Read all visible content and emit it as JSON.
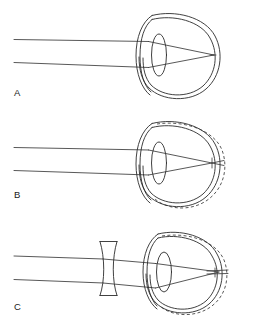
{
  "figure": {
    "width": 253,
    "height": 334,
    "background_color": "#ffffff",
    "line_color": "#2b2b2b",
    "panel_count": 3
  },
  "panels": [
    {
      "id": "A",
      "label": "A",
      "label_x": 14,
      "label_y": 96,
      "caption": "Normal (emmetropic) eye: parallel light rays focus on the retina",
      "eye": {
        "center_x": 179,
        "center_y": 55,
        "outer_rx": 39,
        "outer_ry": 43,
        "inner_rx": 35,
        "inner_ry": 39,
        "has_dashed_elongation": false
      },
      "lens": {
        "center_x": 159,
        "center_y": 55,
        "rx": 7.5,
        "ry": 21
      },
      "cornea": {
        "apex_x": 139,
        "top_y": 33,
        "bottom_y": 78
      },
      "rays": [
        {
          "name": "upper-ray",
          "start_x": 14,
          "start_y": 39,
          "entry_x": 148,
          "entry_y": 39
        },
        {
          "name": "lower-ray",
          "start_x": 14,
          "start_y": 62,
          "entry_x": 148,
          "entry_y": 62
        }
      ],
      "focal_point": {
        "x": 214,
        "y": 55,
        "location": "on retina"
      },
      "corrective_lens": null
    },
    {
      "id": "B",
      "label": "B",
      "label_x": 14,
      "label_y": 198,
      "caption": "Myopic (nearsighted) eye: elongated eyeball, rays focus in front of the retina",
      "eye": {
        "center_x": 179,
        "center_y": 163,
        "outer_rx": 39,
        "outer_ry": 43,
        "inner_rx": 35,
        "inner_ry": 39,
        "has_dashed_elongation": true,
        "dashed_rx": 45,
        "dashed_ry": 45
      },
      "lens": {
        "center_x": 159,
        "center_y": 163,
        "rx": 7.5,
        "ry": 21
      },
      "cornea": {
        "apex_x": 139,
        "top_y": 141,
        "bottom_y": 186
      },
      "rays": [
        {
          "name": "upper-ray",
          "start_x": 14,
          "start_y": 147,
          "entry_x": 148,
          "entry_y": 147
        },
        {
          "name": "lower-ray",
          "start_x": 14,
          "start_y": 170,
          "entry_x": 148,
          "entry_y": 170
        }
      ],
      "focal_point": {
        "x": 212,
        "y": 163,
        "location": "in front of the elongated retina"
      },
      "corrective_lens": null
    },
    {
      "id": "C",
      "label": "C",
      "label_x": 14,
      "label_y": 310,
      "caption": "Myopia corrected: a concave (diverging) lens moves the focus back onto the retina",
      "eye": {
        "center_x": 183,
        "center_y": 272,
        "outer_rx": 37,
        "outer_ry": 41,
        "inner_rx": 33,
        "inner_ry": 37,
        "has_dashed_elongation": true,
        "dashed_rx": 43,
        "dashed_ry": 43
      },
      "lens": {
        "center_x": 164,
        "center_y": 272,
        "rx": 7.5,
        "ry": 20
      },
      "cornea": {
        "apex_x": 146,
        "top_y": 251,
        "bottom_y": 294
      },
      "rays": [
        {
          "name": "upper-ray",
          "start_x": 14,
          "start_y": 256,
          "entry_x": 103,
          "entry_y": 256
        },
        {
          "name": "lower-ray",
          "start_x": 14,
          "start_y": 279,
          "entry_x": 103,
          "entry_y": 279
        }
      ],
      "focal_point": {
        "x": 219,
        "y": 272,
        "location": "on the elongated retina"
      },
      "corrective_lens": {
        "name": "concave-lens",
        "type": "biconcave diverging lens",
        "center_x": 108,
        "top_y": 241,
        "bottom_y": 296,
        "half_width_edge": 9,
        "half_width_waist": 3.5
      }
    }
  ]
}
